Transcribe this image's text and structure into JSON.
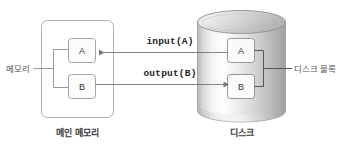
{
  "diagram": {
    "title_main_memory": "메인 메모리",
    "title_disk": "디스크",
    "label_memory": "메모리",
    "label_disk_block": "디스크 블록",
    "memory_blocks": [
      {
        "name": "A"
      },
      {
        "name": "B"
      }
    ],
    "disk_blocks": [
      {
        "name": "A"
      },
      {
        "name": "B"
      }
    ],
    "arrows": [
      {
        "label": "input(A)",
        "direction": "disk-to-memory"
      },
      {
        "label": "output(B)",
        "direction": "memory-to-disk"
      }
    ],
    "colors": {
      "stroke": "#8f8f8f",
      "text": "#555555",
      "text_bold": "#3b3b3b",
      "arrow": "#6e6e6e",
      "cylinder_light": "#f2f2f2",
      "cylinder_mid": "#d8d8d8",
      "cylinder_dark": "#a8a8a8",
      "box_fill": "#fbfbfb",
      "background": "#ffffff"
    }
  }
}
